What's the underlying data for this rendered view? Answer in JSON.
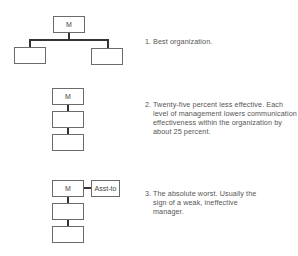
{
  "diagrams": [
    {
      "manager_label": "M",
      "caption_number": "1.",
      "caption_text": "Best organization."
    },
    {
      "manager_label": "M",
      "caption_number": "2.",
      "caption_text": "Twenty-five percent less effective. Each level of management lowers communication effectiveness within the organization by about 25 percent."
    },
    {
      "manager_label": "M",
      "assistant_label": "Asst-to",
      "caption_number": "3.",
      "caption_text": "The absolute worst. Usually the sign of a weak, ineffective manager."
    }
  ]
}
